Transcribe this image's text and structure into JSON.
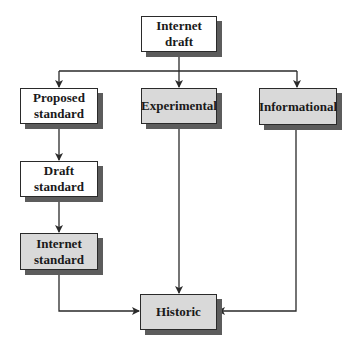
{
  "diagram": {
    "title": "",
    "colors": {
      "white_box": "#ffffff",
      "gray_box": "#d9d9d9",
      "shadow": "#5c5c5c",
      "line": "#2a2a2a"
    },
    "nodes": [
      {
        "id": "internet-draft",
        "label": "Internet\ndraft",
        "fill": "white"
      },
      {
        "id": "proposed-standard",
        "label": "Proposed\nstandard",
        "fill": "white"
      },
      {
        "id": "experimental",
        "label": "Experimental",
        "fill": "gray"
      },
      {
        "id": "informational",
        "label": "Informational",
        "fill": "gray"
      },
      {
        "id": "draft-standard",
        "label": "Draft\nstandard",
        "fill": "white"
      },
      {
        "id": "internet-standard",
        "label": "Internet\nstandard",
        "fill": "gray"
      },
      {
        "id": "historic",
        "label": "Historic",
        "fill": "gray"
      }
    ],
    "edges": [
      {
        "from": "internet-draft",
        "to": "proposed-standard"
      },
      {
        "from": "internet-draft",
        "to": "experimental"
      },
      {
        "from": "internet-draft",
        "to": "informational"
      },
      {
        "from": "proposed-standard",
        "to": "draft-standard"
      },
      {
        "from": "draft-standard",
        "to": "internet-standard"
      },
      {
        "from": "internet-standard",
        "to": "historic"
      },
      {
        "from": "experimental",
        "to": "historic"
      },
      {
        "from": "informational",
        "to": "historic"
      }
    ]
  }
}
